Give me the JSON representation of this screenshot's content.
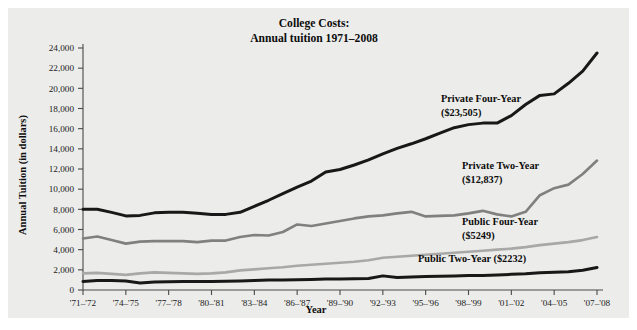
{
  "figure": {
    "background_color": "#ececea",
    "page_color": "#ffffff"
  },
  "chart_data": {
    "type": "line",
    "title": "College Costs:",
    "subtitle": "Annual tuition 1971–2008",
    "xlabel": "Year",
    "ylabel": "Annual Tuition (in dollars)",
    "ylim": [
      0,
      24000
    ],
    "ytick_values": [
      0,
      2000,
      4000,
      6000,
      8000,
      10000,
      12000,
      14000,
      16000,
      18000,
      20000,
      22000,
      24000
    ],
    "ytick_labels": [
      "0",
      "2,000",
      "4,000",
      "6,000",
      "8,000",
      "10,000",
      "12,000",
      "14,000",
      "16,000",
      "18,000",
      "20,000",
      "22,000",
      "24,000"
    ],
    "grid": false,
    "legend_position": "inline-right",
    "x": [
      "'71–'72",
      "'72–'73",
      "'73–'74",
      "'74–'75",
      "'75–'76",
      "'76–'77",
      "'77–'78",
      "'78–'79",
      "'79–'80",
      "'80–'81",
      "'81–'82",
      "'82–'83",
      "'83–'84",
      "'84–'85",
      "'85–'86",
      "'86–'87",
      "'87–'88",
      "'88–'89",
      "'89–'90",
      "'90–'91",
      "'91–'92",
      "'92–'93",
      "'93–'94",
      "'94–'95",
      "'95–'96",
      "'96–'97",
      "'97–'98",
      "'98–'99",
      "'99–'00",
      "'00–'01",
      "'01–'02",
      "'02–'03",
      "'03–'04",
      "'04–'05",
      "'05–'06",
      "'06–'07",
      "'07–'08"
    ],
    "xtick_labels": [
      "'71–'72",
      "'74–'75",
      "'77–'78",
      "'80–'81",
      "'83–'84",
      "'86–'87",
      "'89–'90",
      "'92–'93",
      "'95–'96",
      "'98–'99",
      "'01–'02",
      "'04–'05",
      "'07–'08"
    ],
    "xtick_indices": [
      0,
      3,
      6,
      9,
      12,
      15,
      18,
      21,
      24,
      27,
      30,
      33,
      36
    ],
    "series": [
      {
        "name": "Private Four-Year",
        "final_value_label": "($23,505)",
        "color": "#181818",
        "width": 3.0,
        "values": [
          8000,
          8000,
          7700,
          7350,
          7400,
          7650,
          7700,
          7700,
          7600,
          7500,
          7500,
          7700,
          8300,
          8900,
          9550,
          10200,
          10800,
          11700,
          11950,
          12400,
          12900,
          13500,
          14050,
          14500,
          15000,
          15550,
          16100,
          16400,
          16550,
          16550,
          17300,
          18400,
          19300,
          19450,
          20500,
          21700,
          23505
        ]
      },
      {
        "name": "Private Two-Year",
        "final_value_label": "($12,837)",
        "color": "#808080",
        "width": 2.6,
        "values": [
          5100,
          5300,
          4950,
          4600,
          4800,
          4850,
          4850,
          4850,
          4750,
          4900,
          4900,
          5250,
          5450,
          5400,
          5750,
          6500,
          6350,
          6600,
          6850,
          7100,
          7300,
          7400,
          7600,
          7750,
          7300,
          7350,
          7400,
          7600,
          7850,
          7500,
          7300,
          7750,
          9400,
          10100,
          10450,
          11500,
          12837
        ]
      },
      {
        "name": "Public Four-Year",
        "final_value_label": "($5249)",
        "color": "#a8a8a8",
        "width": 2.6,
        "values": [
          1650,
          1700,
          1600,
          1500,
          1650,
          1750,
          1700,
          1650,
          1600,
          1650,
          1750,
          1950,
          2050,
          2150,
          2250,
          2400,
          2500,
          2600,
          2700,
          2800,
          2950,
          3200,
          3300,
          3400,
          3500,
          3600,
          3700,
          3800,
          3900,
          4000,
          4100,
          4250,
          4450,
          4600,
          4750,
          4950,
          5249
        ]
      },
      {
        "name": "Public Two-Year",
        "final_value_label": "($2232)",
        "color": "#181818",
        "width": 3.0,
        "values": [
          850,
          950,
          950,
          900,
          700,
          800,
          830,
          850,
          850,
          850,
          880,
          900,
          950,
          980,
          1000,
          1020,
          1050,
          1080,
          1100,
          1120,
          1150,
          1400,
          1250,
          1300,
          1330,
          1360,
          1400,
          1430,
          1450,
          1500,
          1550,
          1600,
          1700,
          1750,
          1800,
          1950,
          2232
        ]
      }
    ],
    "annotations": [
      {
        "id": "private-four-year",
        "line1": "Private Four-Year",
        "line2": "($23,505)",
        "x": 441,
        "y": 102
      },
      {
        "id": "private-two-year",
        "line1": "Private Two-Year",
        "line2": "($12,837)",
        "x": 462,
        "y": 169
      },
      {
        "id": "public-four-year",
        "line1": "Public Four-Year",
        "line2": "($5249)",
        "x": 462,
        "y": 225
      },
      {
        "id": "public-two-year",
        "line1": "Public Two-Year ($2232)",
        "line2": "",
        "x": 418,
        "y": 262
      }
    ]
  }
}
